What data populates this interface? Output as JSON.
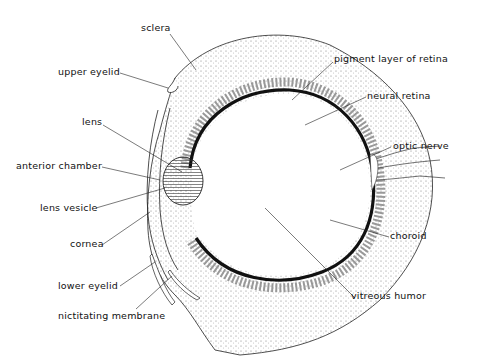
{
  "diagram": {
    "labels": {
      "sclera": "sclera",
      "upper_eyelid": "upper eyelid",
      "lens": "lens",
      "anterior_chamber": "anterior chamber",
      "lens_vesicle": "lens vesicle",
      "cornea": "cornea",
      "lower_eyelid": "lower eyelid",
      "nictitating_membrane": "nictitating membrane",
      "pigment_layer": "pigment layer of retina",
      "neural_retina": "neural retina",
      "optic_nerve": "optic nerve",
      "choroid": "choroid",
      "vitreous_humor": "vitreous humor"
    },
    "colors": {
      "ink": "#111111",
      "stipple": "#555555",
      "background": "#ffffff"
    }
  }
}
